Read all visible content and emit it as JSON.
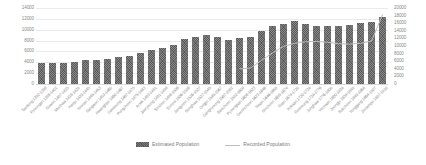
{
  "chart_data": {
    "type": "bar",
    "title": "",
    "xlabel": "",
    "ylabel": "",
    "grid": true,
    "legend_position": "bottom-center",
    "colors": {
      "bar": "#595959",
      "line": "#bdbdbd",
      "gridline": "#e9e9e9",
      "text": "#8a8a8a"
    },
    "y_axis_left": {
      "min": 0,
      "max": 14000,
      "step": 2000,
      "ticks": [
        "0",
        "2000",
        "4000",
        "6000",
        "8000",
        "10000",
        "12000",
        "14000"
      ]
    },
    "y_axis_right": {
      "min": 0,
      "max": 20000,
      "step": 2000,
      "ticks": [
        "0",
        "2000",
        "4000",
        "6000",
        "8000",
        "10000",
        "12000",
        "14000",
        "16000",
        "18000",
        "20000"
      ]
    },
    "categories": [
      "Taedong 1392-1398",
      "Pyeongan 1398-1402",
      "Suwon 1407-1415",
      "Munhwa 1418-1429",
      "Haeju 1429-1445",
      "Yeonan 1445-1453",
      "Sangwon 1453-1460",
      "Hwanghae 1460-1467",
      "Gaeseong 1467-1475",
      "Pungcheon 1475-1483",
      "Anak 1483-1491",
      "Jaeryeong 1491-1498",
      "Sinchon 1498-1506",
      "Eunyul 1506-1516",
      "Jangyeon 1516-1527",
      "Songhwa 1527-1545",
      "Ongjin 1545-1567",
      "Gangnyeong 1567-1592",
      "Baecheon 1592-1608",
      "Pyeongsan 1608-1623",
      "Geumcheon 1623-1646",
      "Tosan 1646-1659",
      "Sincheon 1659-1674",
      "Suan 1674-1720",
      "Koksan 1720-1724",
      "Seoheung 1724-1776",
      "Junghwa 1776-1800",
      "Yeonsan 1800-1834",
      "Jeongju 1834-1849",
      "Sukcheon 1849-1864",
      "Yonggang 1864-1907",
      "Jinnampo 1907-1910"
    ],
    "series": [
      {
        "name": "Estimated Population",
        "kind": "bar",
        "axis": "left",
        "values": [
          3800,
          3800,
          3850,
          4050,
          4450,
          4500,
          4700,
          5000,
          5150,
          5800,
          6250,
          6600,
          7250,
          8250,
          8650,
          8950,
          8600,
          8200,
          8450,
          8700,
          9700,
          10600,
          11100,
          11600,
          11000,
          10700,
          10600,
          10750,
          10900,
          11250,
          11500,
          12400
        ]
      },
      {
        "name": "Recorded Population",
        "kind": "line",
        "axis": "right",
        "values": [
          null,
          null,
          null,
          null,
          null,
          null,
          null,
          null,
          null,
          null,
          null,
          null,
          null,
          null,
          null,
          null,
          null,
          null,
          4000,
          4200,
          6200,
          8200,
          9900,
          10700,
          11100,
          11200,
          11000,
          10600,
          10500,
          10700,
          11300,
          18200
        ]
      }
    ]
  },
  "legend": {
    "items": [
      {
        "label": "Estimated Population",
        "marker": "bar-swatch-icon"
      },
      {
        "label": "Recorded Population",
        "marker": "line-swatch-icon"
      }
    ]
  }
}
